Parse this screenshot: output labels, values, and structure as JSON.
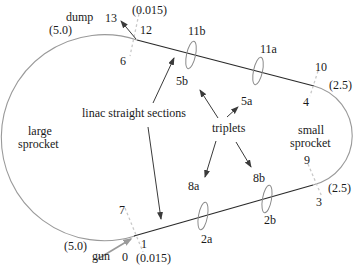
{
  "figure": {
    "type": "recirculating-linac-ring-diagram",
    "labels": {
      "dump": "dump",
      "n13": "13",
      "val_0015_top": "(0.015)",
      "val_50_top": "(5.0)",
      "n12": "12",
      "n6": "6",
      "n11b": "11b",
      "n5b": "5b",
      "n11a": "11a",
      "n5a": "5a",
      "n10": "10",
      "val_25_top": "(2.5)",
      "n4": "4",
      "linac": "linac straight sections",
      "triplets": "triplets",
      "large_sprocket_line1": "large",
      "large_sprocket_line2": "sprocket",
      "small_sprocket_line1": "small",
      "small_sprocket_line2": "sprocket",
      "n9": "9",
      "val_25_bottom": "(2.5)",
      "n3": "3",
      "n8a": "8a",
      "n2a": "2a",
      "n8b": "8b",
      "n2b": "2b",
      "n7": "7",
      "val_50_bottom": "(5.0)",
      "gun": "gun",
      "n0": "0",
      "n1": "1",
      "val_0015_bottom": "(0.015)"
    },
    "colors": {
      "background": "#ffffff",
      "text": "#1a1a1a",
      "line": "#2a2a2a",
      "arc": "#9a9a9a",
      "ellipse": "#8a8a8a",
      "hatch": "#c9c9c9",
      "arrow": "#3a3a3a",
      "gun_arrow": "#9a9a9a"
    }
  }
}
